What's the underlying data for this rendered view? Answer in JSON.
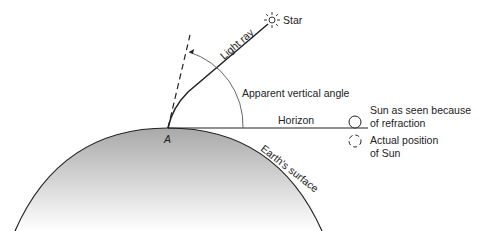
{
  "diagram": {
    "labels": {
      "star": "Star",
      "light_ray": "Light ray",
      "apparent_angle": "Apparent vertical angle",
      "horizon": "Horizon",
      "sun_seen_1": "Sun as seen because",
      "sun_seen_2": "of refraction",
      "actual_1": "Actual position",
      "actual_2": "of Sun",
      "point": "A",
      "earth": "Earth's surface"
    }
  }
}
